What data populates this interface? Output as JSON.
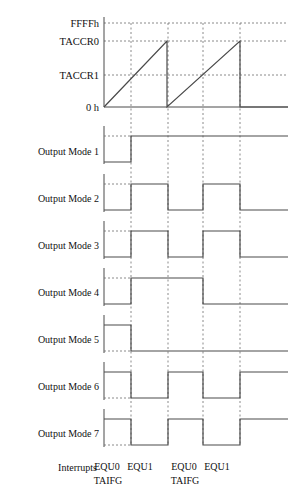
{
  "figure": {
    "colors": {
      "ink": "#4a4a4a",
      "dash": "#6d6d6d",
      "text": "#111111",
      "background": "#ffffff"
    }
  },
  "counter_axis": {
    "labels": [
      {
        "name": "ffffh",
        "text": "FFFFh",
        "y": 23
      },
      {
        "name": "taccr0",
        "text": "TACCR0",
        "y": 41
      },
      {
        "name": "taccr1",
        "text": "TACCR1",
        "y": 75
      },
      {
        "name": "zero",
        "text": "0 h",
        "y": 107
      }
    ],
    "label_x": 99,
    "axis_x": 104,
    "axis_right": 288
  },
  "timeline": {
    "x_start": 104,
    "x_end": 288,
    "events": [
      {
        "name": "equ0-1",
        "label": "EQU0",
        "sub": "TAIFG",
        "x": 104
      },
      {
        "name": "equ1-1",
        "label": "EQU1",
        "sub": "",
        "x": 131
      },
      {
        "name": "equ0-2",
        "label": "EQU0",
        "sub": "TAIFG",
        "x": 168
      },
      {
        "name": "equ1-2",
        "label": "EQU1",
        "sub": "",
        "x": 203
      },
      {
        "name": "equ0-3",
        "label": "",
        "sub": "",
        "x": 240
      }
    ]
  },
  "interrupts": {
    "title": "Interrupts",
    "title_x": 97,
    "title_y": 471,
    "marks": [
      {
        "label": "EQU0",
        "x": 107,
        "y": 470
      },
      {
        "label": "EQU1",
        "x": 140,
        "y": 470
      },
      {
        "label": "TAIFG",
        "x": 108,
        "y": 484
      },
      {
        "label": "EQU0",
        "x": 184,
        "y": 470
      },
      {
        "label": "EQU1",
        "x": 217,
        "y": 470
      },
      {
        "label": "TAIFG",
        "x": 185,
        "y": 484
      }
    ]
  },
  "chart_data": {
    "type": "line",
    "xlabel": "",
    "ylabel": "",
    "grid": true,
    "legend": "none",
    "counter_waveform": {
      "name": "timer-counter-ramp",
      "description": "Up mode sawtooth counting from 0h to TACCR0 and restarting",
      "points": [
        {
          "x": 104,
          "y": 107
        },
        {
          "x": 167,
          "y": 41
        },
        {
          "x": 167,
          "y": 107
        },
        {
          "x": 240,
          "y": 41
        },
        {
          "x": 240,
          "y": 107
        },
        {
          "x": 288,
          "y": 107
        }
      ]
    },
    "rows": [
      {
        "name": "output-mode-1",
        "label": "Output Mode 1",
        "label_y": 151,
        "high_y": 136,
        "low_y": 162,
        "segments": [
          {
            "x0": 104,
            "x1": 131,
            "level": "low"
          },
          {
            "x0": 131,
            "x1": 288,
            "level": "high"
          }
        ]
      },
      {
        "name": "output-mode-2",
        "label": "Output Mode 2",
        "label_y": 198,
        "high_y": 184,
        "low_y": 210,
        "segments": [
          {
            "x0": 104,
            "x1": 131,
            "level": "low"
          },
          {
            "x0": 131,
            "x1": 168,
            "level": "high"
          },
          {
            "x0": 168,
            "x1": 203,
            "level": "low"
          },
          {
            "x0": 203,
            "x1": 240,
            "level": "high"
          },
          {
            "x0": 240,
            "x1": 288,
            "level": "low"
          }
        ]
      },
      {
        "name": "output-mode-3",
        "label": "Output Mode 3",
        "label_y": 245,
        "high_y": 231,
        "low_y": 257,
        "segments": [
          {
            "x0": 104,
            "x1": 131,
            "level": "low"
          },
          {
            "x0": 131,
            "x1": 168,
            "level": "high"
          },
          {
            "x0": 168,
            "x1": 203,
            "level": "low"
          },
          {
            "x0": 203,
            "x1": 240,
            "level": "high"
          },
          {
            "x0": 240,
            "x1": 288,
            "level": "low"
          }
        ]
      },
      {
        "name": "output-mode-4",
        "label": "Output Mode 4",
        "label_y": 292,
        "high_y": 278,
        "low_y": 304,
        "segments": [
          {
            "x0": 104,
            "x1": 131,
            "level": "low"
          },
          {
            "x0": 131,
            "x1": 203,
            "level": "high"
          },
          {
            "x0": 203,
            "x1": 288,
            "level": "low"
          }
        ]
      },
      {
        "name": "output-mode-5",
        "label": "Output Mode 5",
        "label_y": 339,
        "high_y": 325,
        "low_y": 351,
        "segments": [
          {
            "x0": 104,
            "x1": 131,
            "level": "high"
          },
          {
            "x0": 131,
            "x1": 288,
            "level": "low"
          }
        ]
      },
      {
        "name": "output-mode-6",
        "label": "Output Mode 6",
        "label_y": 386,
        "high_y": 372,
        "low_y": 398,
        "segments": [
          {
            "x0": 104,
            "x1": 131,
            "level": "high"
          },
          {
            "x0": 131,
            "x1": 168,
            "level": "low"
          },
          {
            "x0": 168,
            "x1": 203,
            "level": "high"
          },
          {
            "x0": 203,
            "x1": 240,
            "level": "low"
          },
          {
            "x0": 240,
            "x1": 288,
            "level": "high"
          }
        ]
      },
      {
        "name": "output-mode-7",
        "label": "Output Mode 7",
        "label_y": 433,
        "high_y": 419,
        "low_y": 445,
        "segments": [
          {
            "x0": 104,
            "x1": 131,
            "level": "high"
          },
          {
            "x0": 131,
            "x1": 168,
            "level": "low"
          },
          {
            "x0": 168,
            "x1": 203,
            "level": "high"
          },
          {
            "x0": 203,
            "x1": 240,
            "level": "low"
          },
          {
            "x0": 240,
            "x1": 288,
            "level": "high"
          }
        ]
      }
    ]
  }
}
